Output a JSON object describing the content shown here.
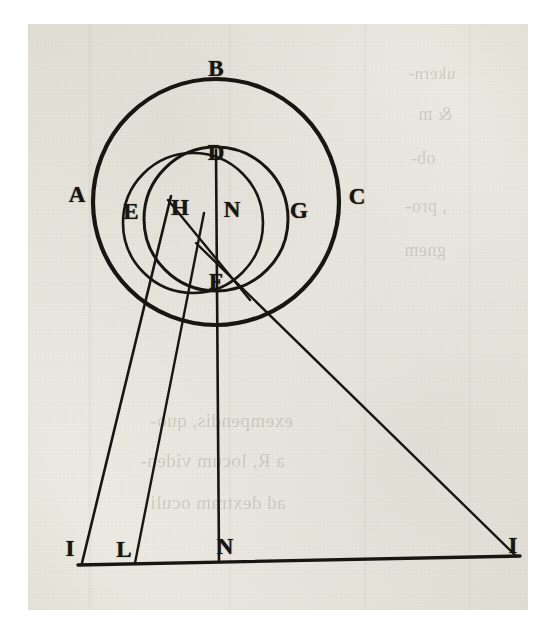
{
  "document": {
    "kind": "printed-engraving",
    "title": "Geometric optical diagram with concentric circles and projection lines",
    "ink_color": "#191612",
    "paper_color": "#eceae2",
    "showthrough_color": "#8e897c"
  },
  "figure": {
    "labels": [
      {
        "id": "A",
        "text": "A",
        "x": 77,
        "y": 194,
        "note": "outside outer circle, left"
      },
      {
        "id": "B",
        "text": "B",
        "x": 216,
        "y": 68,
        "note": "above outer circle, top"
      },
      {
        "id": "C",
        "text": "C",
        "x": 357,
        "y": 196,
        "note": "outside outer circle, right"
      },
      {
        "id": "D",
        "text": "D",
        "x": 216,
        "y": 152,
        "note": "top of inner circle"
      },
      {
        "id": "E",
        "text": "E",
        "x": 131,
        "y": 211,
        "note": "inside outer circle, left of inner"
      },
      {
        "id": "H",
        "text": "H",
        "x": 180,
        "y": 207,
        "note": "on offset circle, left of centre"
      },
      {
        "id": "N",
        "text": "N",
        "x": 232,
        "y": 209,
        "note": "centre of circles"
      },
      {
        "id": "G",
        "text": "G",
        "x": 299,
        "y": 210,
        "note": "inside outer circle, right of inner"
      },
      {
        "id": "F",
        "text": "F",
        "x": 216,
        "y": 281,
        "note": "bottom of inner circle, ray crossing"
      },
      {
        "id": "I_left",
        "text": "I",
        "x": 70,
        "y": 548,
        "note": "baseline, left foot of slanted ray"
      },
      {
        "id": "L",
        "text": "L",
        "x": 124,
        "y": 549,
        "note": "baseline, foot of second line"
      },
      {
        "id": "N_base",
        "text": "N",
        "x": 225,
        "y": 546,
        "note": "baseline, foot of central vertical"
      },
      {
        "id": "I_right",
        "text": "I",
        "x": 513,
        "y": 545,
        "note": "baseline, right end of diagonal ray"
      }
    ],
    "circles": [
      {
        "id": "outer-circle",
        "cx": 216,
        "cy": 202,
        "r": 123,
        "stroke": "#191612",
        "width": 4.2,
        "note": "circle A B C"
      },
      {
        "id": "inner-circle",
        "cx": 216,
        "cy": 219,
        "r": 72,
        "stroke": "#191612",
        "width": 3.0,
        "note": "circle D N F"
      },
      {
        "id": "offset-circle",
        "cx": 193,
        "cy": 223,
        "r": 70,
        "stroke": "#191612",
        "width": 2.6,
        "note": "circle through H and F, shifted left"
      }
    ],
    "lines": [
      {
        "id": "baseline",
        "x1": 78,
        "y1": 565,
        "x2": 520,
        "y2": 556,
        "width": 3.4,
        "note": "horizontal ground line I L N I"
      },
      {
        "id": "ray-H-to-I",
        "x1": 171,
        "y1": 196,
        "x2": 82,
        "y2": 563,
        "width": 2.6,
        "note": "slanted ray from H down to left point I"
      },
      {
        "id": "ray-F-to-L",
        "x1": 204,
        "y1": 213,
        "x2": 135,
        "y2": 563,
        "width": 2.4,
        "note": "second near-vertical line to L"
      },
      {
        "id": "axis-D-to-N",
        "x1": 216,
        "y1": 150,
        "x2": 219,
        "y2": 560,
        "width": 2.6,
        "note": "central vertical axis D - N - F - N(base)"
      },
      {
        "id": "ray-H-to-F-right",
        "x1": 168,
        "y1": 200,
        "x2": 250,
        "y2": 300,
        "width": 2.4,
        "note": "chord from H crossing through F region"
      },
      {
        "id": "ray-F-to-I-right",
        "x1": 196,
        "y1": 243,
        "x2": 516,
        "y2": 556,
        "width": 2.4,
        "note": "long diagonal ray to right point I"
      }
    ]
  },
  "showthrough": [
    {
      "text": "ukern-",
      "x": 408,
      "y": 64,
      "size": 17
    },
    {
      "text": "& m",
      "x": 418,
      "y": 104,
      "size": 18
    },
    {
      "text": "ob-",
      "x": 410,
      "y": 148,
      "size": 18
    },
    {
      "text": ", pro-",
      "x": 405,
      "y": 196,
      "size": 18
    },
    {
      "text": "gnem",
      "x": 404,
      "y": 240,
      "size": 18
    },
    {
      "text": "exempendis, quo-",
      "x": 150,
      "y": 410,
      "size": 19
    },
    {
      "text": "a R, locum viden-",
      "x": 140,
      "y": 450,
      "size": 19
    },
    {
      "text": "ad dextram oculi",
      "x": 150,
      "y": 492,
      "size": 19
    }
  ]
}
